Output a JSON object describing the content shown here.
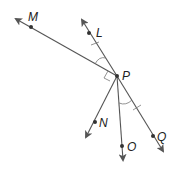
{
  "diagram": {
    "vertex": {
      "label": "P",
      "x": 117,
      "y": 76
    },
    "points": [
      {
        "label": "M",
        "x": 31,
        "y": 27,
        "tip": [
          16,
          19
        ],
        "label_pos": [
          30,
          21
        ]
      },
      {
        "label": "L",
        "x": 89,
        "y": 33,
        "tip": [
          82,
          20
        ],
        "label_pos": [
          96,
          37
        ]
      },
      {
        "label": "N",
        "x": 95,
        "y": 122,
        "tip": [
          86,
          137
        ],
        "label_pos": [
          99,
          127
        ]
      },
      {
        "label": "O",
        "x": 122,
        "y": 146,
        "tip": [
          123,
          160
        ],
        "label_pos": [
          127,
          151
        ]
      },
      {
        "label": "Q",
        "x": 153,
        "y": 136,
        "tip": [
          163,
          151
        ],
        "label_pos": [
          157,
          141
        ]
      }
    ],
    "marks": {
      "congruent_angles": [
        "MPL",
        "OPQ"
      ],
      "right_angle": "MPN",
      "congruent_segments": [
        "PL",
        "PQ"
      ]
    },
    "colors": {
      "line": "#555555",
      "point": "#333333",
      "label": "#222222"
    }
  }
}
